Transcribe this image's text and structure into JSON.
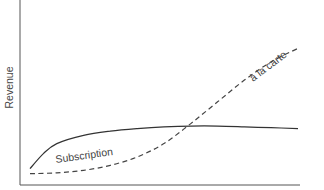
{
  "chart_data": {
    "type": "line",
    "title": "",
    "xlabel": "",
    "ylabel": "Revenue",
    "xlim": [
      0,
      100
    ],
    "ylim": [
      0,
      100
    ],
    "grid": false,
    "ticks": false,
    "legend": "none (inline labels)",
    "series": [
      {
        "name": "Subscription",
        "style": "solid",
        "color": "#333333",
        "x": [
          0,
          5,
          10,
          20,
          30,
          40,
          50,
          60,
          70,
          80,
          90,
          100
        ],
        "y": [
          5,
          14,
          20,
          25,
          27.5,
          29,
          30,
          30.5,
          30.5,
          30,
          29.5,
          29
        ]
      },
      {
        "name": "à la carte",
        "style": "dashed",
        "color": "#444444",
        "x": [
          0,
          10,
          20,
          30,
          40,
          50,
          60,
          70,
          80,
          90,
          100
        ],
        "y": [
          2,
          2.5,
          4,
          7,
          12,
          20,
          32,
          45,
          58,
          69,
          77
        ]
      }
    ],
    "annotations": [
      {
        "text": "Subscription",
        "series": "Subscription",
        "position": "below curve, left"
      },
      {
        "text": "à la carte",
        "series": "à la carte",
        "position": "above curve, upper right"
      }
    ]
  }
}
